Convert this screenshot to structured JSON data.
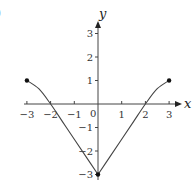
{
  "chart_data": {
    "type": "line",
    "title": "",
    "panel_label_fragment": ")",
    "xlabel": "x",
    "ylabel": "y",
    "xlim": [
      -3,
      3
    ],
    "ylim": [
      -3,
      3
    ],
    "x_ticks": [
      -3,
      -2,
      -1,
      1,
      2,
      3
    ],
    "x_tick_labels": [
      "−3",
      "−2",
      "−1",
      "1",
      "2",
      "3"
    ],
    "y_ticks": [
      3,
      2,
      1,
      -1,
      -2,
      -3
    ],
    "y_tick_labels": [
      "3",
      "2",
      "1",
      "−1",
      "−2",
      "−3"
    ],
    "origin_label": "0",
    "grid": false,
    "series": [
      {
        "name": "f",
        "x": [
          -3,
          -2.5,
          -2,
          -1.5,
          -1,
          -0.5,
          0,
          0.5,
          1,
          1.5,
          2,
          2.5,
          3
        ],
        "y": [
          1,
          0.65,
          0,
          -0.75,
          -1.5,
          -2.25,
          -3,
          -2.25,
          -1.5,
          -0.75,
          0,
          0.65,
          1
        ]
      }
    ],
    "endpoints": [
      {
        "x": -3,
        "y": 1,
        "filled": true
      },
      {
        "x": 0,
        "y": -3,
        "filled": true
      },
      {
        "x": 3,
        "y": 1,
        "filled": true
      }
    ],
    "x_intercepts": [
      -2,
      2
    ],
    "y_intercept": -3
  }
}
